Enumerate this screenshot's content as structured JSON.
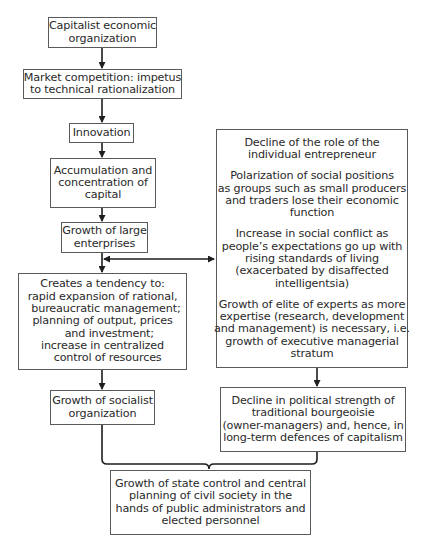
{
  "diagram": {
    "nodes": {
      "capitalist_org": {
        "lines": [
          "Capitalist economic",
          "organization"
        ]
      },
      "market_competition": {
        "lines": [
          "Market competition: impetus",
          "to technical rationalization"
        ]
      },
      "innovation": {
        "lines": [
          "Innovation"
        ]
      },
      "accumulation": {
        "lines": [
          "Accumulation and",
          "concentration of",
          "capital"
        ]
      },
      "large_enterprises": {
        "lines": [
          "Growth of large",
          "enterprises"
        ]
      },
      "tendency": {
        "lines": [
          "Creates a tendency to:",
          "rapid expansion of rational,",
          "  bureaucratic management;",
          "planning of output, prices",
          "    and investment;",
          "increase in centralized",
          "   control of resources"
        ]
      },
      "socialist_org": {
        "lines": [
          "Growth of socialist",
          "organization"
        ]
      },
      "consequences": {
        "paragraphs": [
          {
            "lines": [
              "Decline of the role of the",
              "individual entrepreneur"
            ]
          },
          {
            "lines": [
              "Polarization of social positions",
              "as groups such as small producers",
              "and traders lose their economic",
              "function"
            ]
          },
          {
            "lines": [
              "Increase in social conflict as",
              "people’s expectations go up with",
              "rising standards of living",
              "(exacerbated by disaffected",
              "intelligentsia)"
            ]
          },
          {
            "lines": [
              "Growth of elite of experts as more",
              "expertise (research, development",
              "and management) is necessary, i.e.",
              "growth of executive managerial",
              "stratum"
            ]
          }
        ]
      },
      "bourgeoisie_decline": {
        "lines": [
          "Decline in political strength of",
          "traditional bourgeoisie",
          "(owner-managers) and, hence, in",
          "long-term defences of capitalism"
        ]
      },
      "state_control": {
        "lines": [
          "Growth of state control and central",
          "planning of civil society in the",
          "hands of public administrators and",
          "elected personnel"
        ]
      }
    },
    "edges": [
      {
        "from": "capitalist_org",
        "to": "market_competition",
        "type": "arrow"
      },
      {
        "from": "market_competition",
        "to": "innovation",
        "type": "arrow"
      },
      {
        "from": "innovation",
        "to": "accumulation",
        "type": "arrow"
      },
      {
        "from": "accumulation",
        "to": "large_enterprises",
        "type": "arrow"
      },
      {
        "from": "large_enterprises",
        "to": "tendency",
        "type": "arrow"
      },
      {
        "from": "large_enterprises",
        "to": "consequences",
        "type": "double-arrow"
      },
      {
        "from": "tendency",
        "to": "socialist_org",
        "type": "arrow"
      },
      {
        "from": "consequences",
        "to": "bourgeoisie_decline",
        "type": "arrow"
      },
      {
        "from": [
          "socialist_org",
          "bourgeoisie_decline"
        ],
        "to": "state_control",
        "type": "brace"
      }
    ],
    "colors": {
      "stroke": "#2a2a2a",
      "border": "#5a5a5a",
      "text": "#2a2a2a",
      "background": "#ffffff"
    }
  }
}
